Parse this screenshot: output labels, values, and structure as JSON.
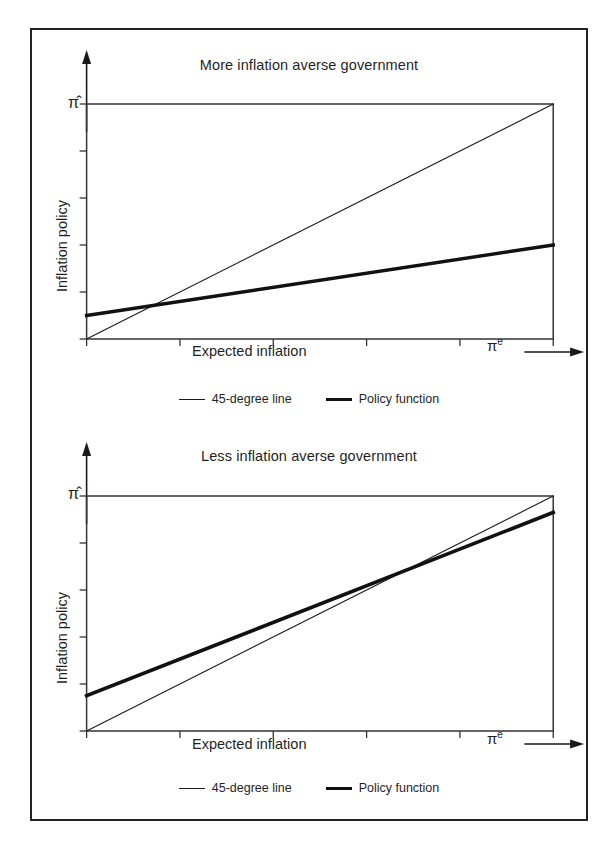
{
  "figure": {
    "panel_count": 2,
    "frame_color": "#222222",
    "background": "#ffffff"
  },
  "chart_data": [
    {
      "type": "line",
      "title": "More inflation averse government",
      "xlabel": "Expected inflation",
      "ylabel": "Inflation policy",
      "x_axis_symbol": "π",
      "x_axis_symbol_sup": "e",
      "y_axis_symbol": "π̂",
      "xlim": [
        0,
        100
      ],
      "ylim": [
        0,
        100
      ],
      "grid": false,
      "x_ticks": [
        0,
        20,
        40,
        60,
        80,
        100
      ],
      "y_ticks": [
        0,
        20,
        40,
        60,
        80,
        100
      ],
      "tick_labels_shown": false,
      "legend_position": "below-axes",
      "series": [
        {
          "name": "45-degree line",
          "style": "thin",
          "line_width": 1.1,
          "color": "#1a1a1a",
          "x": [
            0,
            100
          ],
          "values": [
            0,
            100
          ]
        },
        {
          "name": "Policy function",
          "style": "thick",
          "line_width": 3.4,
          "color": "#111111",
          "x": [
            0,
            100
          ],
          "values": [
            10,
            40
          ],
          "intercept": 10,
          "slope": 0.3
        }
      ],
      "annotations": [
        {
          "text": "Lines intersect at low inflation",
          "x": 14,
          "y": 14,
          "shown": false
        }
      ]
    },
    {
      "type": "line",
      "title": "Less inflation averse government",
      "xlabel": "Expected inflation",
      "ylabel": "Inflation policy",
      "x_axis_symbol": "π",
      "x_axis_symbol_sup": "e",
      "y_axis_symbol": "π̂",
      "xlim": [
        0,
        100
      ],
      "ylim": [
        0,
        100
      ],
      "grid": false,
      "x_ticks": [
        0,
        20,
        40,
        60,
        80,
        100
      ],
      "y_ticks": [
        0,
        20,
        40,
        60,
        80,
        100
      ],
      "tick_labels_shown": false,
      "legend_position": "below-axes",
      "series": [
        {
          "name": "45-degree line",
          "style": "thin",
          "line_width": 1.1,
          "color": "#1a1a1a",
          "x": [
            0,
            100
          ],
          "values": [
            0,
            100
          ]
        },
        {
          "name": "Policy function",
          "style": "thick",
          "line_width": 3.6,
          "color": "#111111",
          "x": [
            0,
            100
          ],
          "values": [
            15,
            93
          ],
          "intercept": 15,
          "slope": 0.78
        }
      ],
      "annotations": [
        {
          "text": "Lines intersect at high inflation",
          "x": 68,
          "y": 68,
          "shown": false
        }
      ]
    }
  ],
  "legend": {
    "items": [
      {
        "label": "45-degree line",
        "style": "thin"
      },
      {
        "label": "Policy function",
        "style": "thick"
      }
    ]
  }
}
